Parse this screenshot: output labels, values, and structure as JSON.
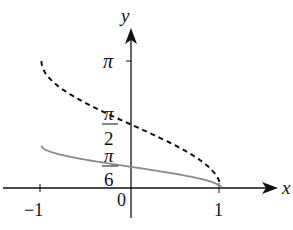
{
  "chart_data": {
    "type": "line",
    "title": "",
    "xlabel": "x",
    "ylabel": "y",
    "xlim": [
      -1,
      1
    ],
    "ylim": [
      0,
      3.14159
    ],
    "grid": false,
    "legend": null,
    "x_ticks": [
      {
        "value": -1,
        "label": "−1"
      },
      {
        "value": 1,
        "label": "1"
      }
    ],
    "origin_label": "0",
    "y_ticks": [
      {
        "value": 3.14159,
        "label": "π"
      },
      {
        "value": 1.5708,
        "label_num": "π",
        "label_den": "2"
      },
      {
        "value": 0.5236,
        "label_num": "π",
        "label_den": "6"
      }
    ],
    "series": [
      {
        "name": "y = arccos x",
        "style": "dashed",
        "color": "#111111",
        "x": [
          -1,
          -0.9,
          -0.75,
          -0.5,
          -0.25,
          0,
          0.25,
          0.5,
          0.75,
          0.9,
          1
        ],
        "y": [
          3.1416,
          2.6906,
          2.4189,
          2.0944,
          1.8235,
          1.5708,
          1.3181,
          1.0472,
          0.7227,
          0.451,
          0
        ]
      },
      {
        "name": "y = (1/3) arccos x",
        "style": "solid",
        "color": "#888888",
        "x": [
          -1,
          -0.9,
          -0.75,
          -0.5,
          -0.25,
          0,
          0.25,
          0.5,
          0.75,
          0.9,
          1
        ],
        "y": [
          1.0472,
          0.8969,
          0.8063,
          0.6981,
          0.6078,
          0.5236,
          0.4394,
          0.3491,
          0.2409,
          0.1503,
          0
        ]
      }
    ]
  },
  "axes": {
    "x_name": "x",
    "y_name": "y",
    "origin": "0",
    "x_neg_tick": "−1",
    "x_pos_tick": "1",
    "y_pi": "π",
    "y_half_num": "π",
    "y_half_den": "2",
    "y_sixth_num": "π",
    "y_sixth_den": "6"
  }
}
